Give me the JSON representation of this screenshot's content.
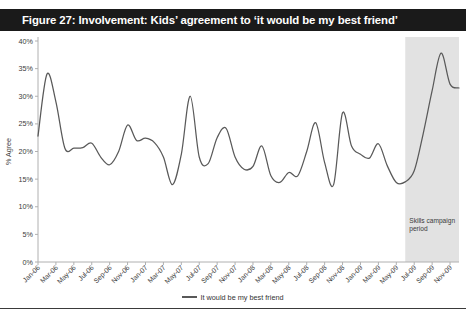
{
  "title": "Figure 27: Involvement: Kids’ agreement to ‘it would be my best friend’",
  "legend": {
    "label": "It would be my best friend"
  },
  "annotation": {
    "line1": "Skills campaign",
    "line2": "period"
  },
  "colors": {
    "title_bar": "#1a1a1a",
    "title_text": "#ffffff",
    "line": "#595959",
    "shaded_band": "#e2e2e2",
    "axis": "#b0b0b0",
    "tick_label": "#3a3a3a",
    "background": "#ffffff"
  },
  "chart_data": {
    "type": "line",
    "title": "Figure 27: Involvement: Kids’ agreement to ‘it would be my best friend’",
    "xlabel": "",
    "ylabel": "% Agree",
    "ylim": [
      0,
      40
    ],
    "ytick_step": 5,
    "ytick_labels": [
      "0%",
      "5%",
      "10%",
      "15%",
      "20%",
      "25%",
      "30%",
      "35%",
      "40%"
    ],
    "ytick_values": [
      0,
      5,
      10,
      15,
      20,
      25,
      30,
      35,
      40
    ],
    "grid": false,
    "legend_position": "bottom-center",
    "xtick_labels": [
      "Jan-06",
      "Mar-06",
      "May-06",
      "Jul-06",
      "Sep-06",
      "Nov-06",
      "Jan-07",
      "Mar-07",
      "May-07",
      "Jul-07",
      "Sep-07",
      "Nov-07",
      "Jan-08",
      "Mar-08",
      "May-08",
      "Jul-08",
      "Sep-08",
      "Nov-08",
      "Jan-09",
      "Mar-09",
      "May-09",
      "Jul-09",
      "Sep-09",
      "Nov-09"
    ],
    "xtick_interval_months": 2,
    "x": [
      "Jan-06",
      "Feb-06",
      "Mar-06",
      "Apr-06",
      "May-06",
      "Jun-06",
      "Jul-06",
      "Aug-06",
      "Sep-06",
      "Oct-06",
      "Nov-06",
      "Dec-06",
      "Jan-07",
      "Feb-07",
      "Mar-07",
      "Apr-07",
      "May-07",
      "Jun-07",
      "Jul-07",
      "Aug-07",
      "Sep-07",
      "Oct-07",
      "Nov-07",
      "Dec-07",
      "Jan-08",
      "Feb-08",
      "Mar-08",
      "Apr-08",
      "May-08",
      "Jun-08",
      "Jul-08",
      "Aug-08",
      "Sep-08",
      "Oct-08",
      "Nov-08",
      "Dec-08",
      "Jan-09",
      "Feb-09",
      "Mar-09",
      "Apr-09",
      "May-09",
      "Jun-09",
      "Jul-09",
      "Aug-09",
      "Sep-09",
      "Oct-09",
      "Nov-09",
      "Dec-09"
    ],
    "series": [
      {
        "name": "It would be my best friend",
        "color": "#595959",
        "values": [
          22.8,
          34.0,
          29.0,
          20.6,
          20.6,
          20.7,
          21.5,
          19.0,
          17.6,
          20.0,
          24.8,
          22.0,
          22.4,
          21.6,
          19.0,
          14.0,
          19.5,
          30.0,
          19.0,
          17.8,
          22.5,
          24.2,
          19.0,
          16.8,
          17.3,
          21.0,
          15.6,
          14.4,
          16.2,
          15.6,
          20.0,
          25.2,
          18.0,
          14.0,
          27.0,
          21.0,
          19.5,
          18.8,
          21.4,
          17.4,
          14.4,
          14.5,
          16.5,
          23.2,
          31.0,
          37.8,
          32.2,
          31.5
        ]
      }
    ],
    "shaded_region": {
      "label": "Skills campaign period",
      "start": "Jun-09",
      "end": "Dec-09",
      "color": "#e2e2e2"
    }
  }
}
